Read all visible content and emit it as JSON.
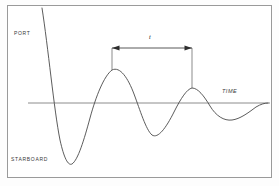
{
  "figure": {
    "background_color": "#ffffff",
    "frame_color": "#9a9a9a",
    "curve_color": "#4a4a4a",
    "axis_color": "#6e6e6e",
    "annotation_color": "#2e2e2e"
  },
  "labels": {
    "port": "PORT",
    "starboard": "STARBOARD",
    "roll_angle": "ROLL ANGLE",
    "time": "TIME",
    "period": "t"
  },
  "chart_data": {
    "type": "line",
    "title": "",
    "xlabel": "TIME",
    "ylabel": "ROLL ANGLE",
    "subtitle": "",
    "grid": false,
    "legend": null,
    "axis": {
      "zero_line_y": 103,
      "zero_line_x_start": 28,
      "zero_line_x_end": 270,
      "positive_direction_label": "PORT",
      "negative_direction_label": "STARBOARD"
    },
    "annotations": [
      {
        "label": "t",
        "type": "double-headed-arrow",
        "meaning": "roll period between successive peaks",
        "x_start": 112,
        "x_end": 192,
        "y": 48,
        "drop_line_start_y": 70,
        "drop_line_end_y": 88
      }
    ],
    "extrema": [
      {
        "kind": "peak",
        "x": 42,
        "y": 8,
        "side": "port",
        "amplitude_rel": 1.0
      },
      {
        "kind": "trough",
        "x": 68,
        "y": 165,
        "side": "starboard",
        "amplitude_rel": 0.88
      },
      {
        "kind": "peak",
        "x": 112,
        "y": 70,
        "side": "port",
        "amplitude_rel": 0.5
      },
      {
        "kind": "trough",
        "x": 152,
        "y": 135,
        "side": "starboard",
        "amplitude_rel": 0.45
      },
      {
        "kind": "peak",
        "x": 192,
        "y": 88,
        "side": "port",
        "amplitude_rel": 0.22
      },
      {
        "kind": "trough",
        "x": 232,
        "y": 120,
        "side": "starboard",
        "amplitude_rel": 0.25
      },
      {
        "kind": "end",
        "x": 268,
        "y": 103,
        "side": "zero",
        "amplitude_rel": 0.0
      }
    ],
    "path": "M 42,8 C 48,46 54,110 60,140 C 64,158 68,166 72,164 C 78,160 84,140 90,118 C 96,96 104,76 112,70 C 120,66 128,78 134,94 C 140,110 146,130 152,135 C 158,139 166,128 174,112 C 181,98 187,89 192,88 C 198,88 204,96 210,106 C 216,116 224,121 232,120 C 240,119 248,113 256,107 C 261,104 265,103 268,103"
  }
}
